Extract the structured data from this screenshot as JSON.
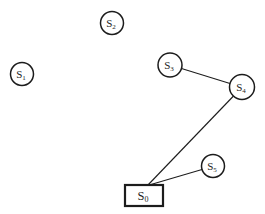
{
  "diagram": {
    "background": "#ffffff",
    "stroke_color": "#1c1c1c",
    "circle_stroke_width": 1.5,
    "rect_stroke_width": 2.2,
    "edge_stroke_width": 1.1,
    "nodes": [
      {
        "id": "S2",
        "shape": "circle",
        "label": "S",
        "subscript": "2",
        "x": 112,
        "y": 23,
        "r": 11.5
      },
      {
        "id": "S1",
        "shape": "circle",
        "label": "S",
        "subscript": "1",
        "x": 22,
        "y": 74,
        "r": 11.5
      },
      {
        "id": "S3",
        "shape": "circle",
        "label": "S",
        "subscript": "3",
        "x": 170,
        "y": 65,
        "r": 12
      },
      {
        "id": "S4",
        "shape": "circle",
        "label": "S",
        "subscript": "4",
        "x": 242,
        "y": 87,
        "r": 12.5
      },
      {
        "id": "S5",
        "shape": "circle",
        "label": "S",
        "subscript": "5",
        "x": 213,
        "y": 166,
        "r": 11.5
      },
      {
        "id": "S0",
        "shape": "rect",
        "label": "S",
        "subscript": "0",
        "x": 144,
        "y": 195.5,
        "w": 38,
        "h": 21
      }
    ],
    "edges": [
      {
        "from": "S3",
        "to": "S4",
        "x1": 181.5,
        "y1": 68.5,
        "x2": 230,
        "y2": 83.5
      },
      {
        "from": "S4",
        "to": "S0",
        "x1": 233.5,
        "y1": 96,
        "x2": 147.5,
        "y2": 185.5
      },
      {
        "from": "S5",
        "to": "S0",
        "x1": 202,
        "y1": 169.5,
        "x2": 147.5,
        "y2": 185.5
      }
    ]
  }
}
